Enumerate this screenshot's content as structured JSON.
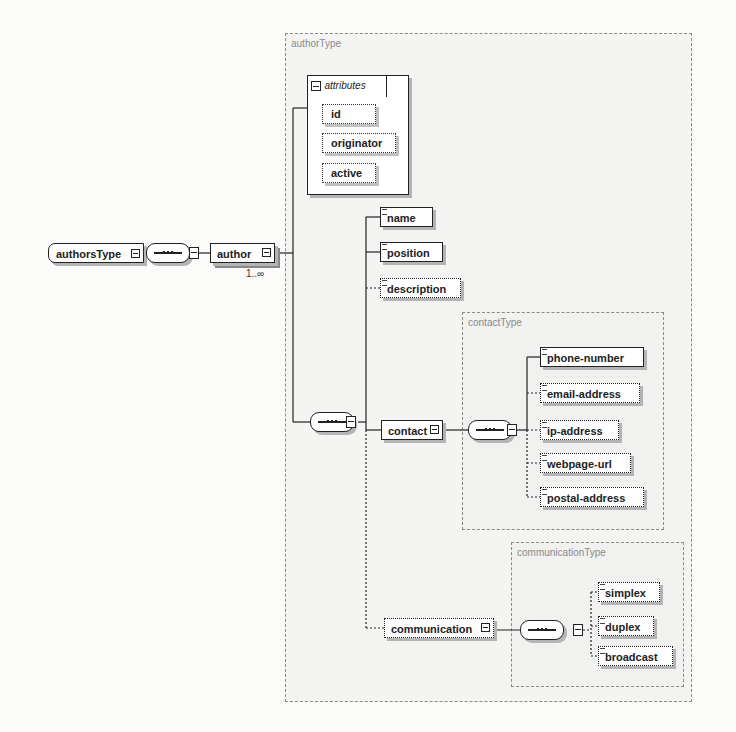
{
  "diagram": {
    "root": {
      "label": "authorsType"
    },
    "author": {
      "label": "author",
      "cardinality": "1..∞"
    },
    "authorType": {
      "label": "authorType",
      "attributes": {
        "header": "attributes",
        "items": [
          {
            "label": "id"
          },
          {
            "label": "originator"
          },
          {
            "label": "active"
          }
        ]
      },
      "elements": [
        {
          "label": "name",
          "optional": false
        },
        {
          "label": "position",
          "optional": false
        },
        {
          "label": "description",
          "optional": true
        },
        {
          "label": "contact",
          "optional": false
        },
        {
          "label": "communication",
          "optional": true
        }
      ]
    },
    "contactType": {
      "label": "contactType",
      "elements": [
        {
          "label": "phone-number",
          "optional": false
        },
        {
          "label": "email-address",
          "optional": true
        },
        {
          "label": "ip-address",
          "optional": true
        },
        {
          "label": "webpage-url",
          "optional": true
        },
        {
          "label": "postal-address",
          "optional": true
        }
      ]
    },
    "communicationType": {
      "label": "communicationType",
      "elements": [
        {
          "label": "simplex",
          "optional": true
        },
        {
          "label": "duplex",
          "optional": true
        },
        {
          "label": "broadcast",
          "optional": true
        }
      ]
    },
    "colors": {
      "stroke": "#222222",
      "shadow": "#b4b4b4",
      "group_border": "#8a8a8a",
      "group_label": "#8a8a8a"
    }
  }
}
